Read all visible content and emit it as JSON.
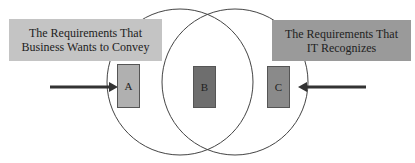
{
  "diagram": {
    "left_label": "The Requirements That Business Wants to Convey",
    "right_label": "The Requirements That IT Recognizes",
    "regions": [
      {
        "id": "A",
        "label": "A",
        "color": "#b0b0b0"
      },
      {
        "id": "B",
        "label": "B",
        "color": "#6e6e6e"
      },
      {
        "id": "C",
        "label": "C",
        "color": "#8a8a8a"
      }
    ],
    "colors": {
      "left_label_bg": "#c4c4c4",
      "right_label_bg": "#9a9a9a",
      "arrow": "#333333",
      "circle_stroke": "#444444"
    }
  }
}
